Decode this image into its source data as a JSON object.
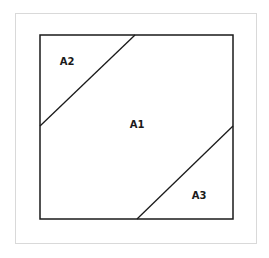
{
  "diagram": {
    "type": "square-partition",
    "frame_color": "#d9d9d9",
    "line_color": "#1a1a1a",
    "regions": [
      {
        "id": "A1",
        "label": "A1",
        "x": 137,
        "y": 127
      },
      {
        "id": "A2",
        "label": "A2",
        "x": 67,
        "y": 65
      },
      {
        "id": "A3",
        "label": "A3",
        "x": 199,
        "y": 199
      }
    ]
  }
}
